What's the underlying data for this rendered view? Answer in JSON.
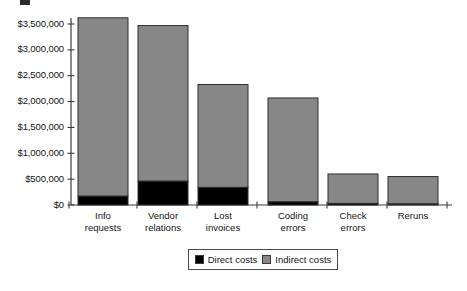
{
  "figure": {
    "caption_fragment": ""
  },
  "legend": {
    "position": "bottom-center",
    "entries": [
      {
        "label": "Direct costs",
        "color": "#000000",
        "swatch_name": "legend-swatch-direct"
      },
      {
        "label": "Indirect costs",
        "color": "#878787",
        "swatch_name": "legend-swatch-indirect"
      }
    ]
  },
  "chart_data": {
    "type": "bar",
    "subtype": "stacked-vertical",
    "title": "",
    "subtitle": "",
    "xlabel": "",
    "ylabel": "",
    "grid": false,
    "ylim": [
      0,
      3800000
    ],
    "ytick_values": [
      0,
      500000,
      1000000,
      1500000,
      2000000,
      2500000,
      3000000,
      3500000
    ],
    "ytick_labels": [
      "$0",
      "$500,000",
      "$1,000,000",
      "$1,500,000",
      "$2,000,000",
      "$2,500,000",
      "$3,000,000",
      "$3,500,000"
    ],
    "categories": [
      "Info requests",
      "Vendor relations",
      "Lost invoices",
      "Coding errors",
      "Check errors",
      "Reruns"
    ],
    "category_lines": [
      [
        "Info",
        "requests"
      ],
      [
        "Vendor",
        "relations"
      ],
      [
        "Lost",
        "invoices"
      ],
      [
        "Coding",
        "errors"
      ],
      [
        "Check",
        "errors"
      ],
      [
        "Reruns"
      ]
    ],
    "series": [
      {
        "name": "Direct costs",
        "color": "#000000",
        "values": [
          170000,
          460000,
          340000,
          60000,
          30000,
          20000
        ]
      },
      {
        "name": "Indirect costs",
        "color": "#878787",
        "values": [
          3450000,
          3010000,
          1990000,
          2010000,
          570000,
          530000
        ]
      }
    ],
    "totals": [
      3620000,
      3470000,
      2330000,
      2070000,
      600000,
      550000
    ]
  },
  "axes": {
    "line_color": "#3c3c3c",
    "bar_edge_color": "#2e2e2e"
  }
}
